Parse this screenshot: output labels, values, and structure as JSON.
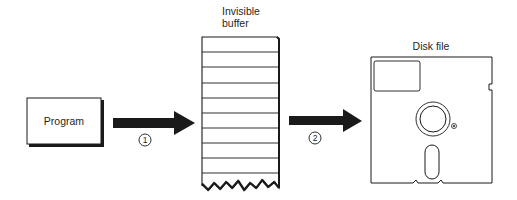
{
  "diagram": {
    "program": {
      "label": "Program"
    },
    "buffer": {
      "label_line1": "Invisible",
      "label_line2": "buffer",
      "rows": 10
    },
    "disk": {
      "label": "Disk file"
    },
    "steps": [
      {
        "number": "1",
        "from": "Program",
        "to": "Invisible buffer"
      },
      {
        "number": "2",
        "from": "Invisible buffer",
        "to": "Disk file"
      }
    ]
  },
  "colors": {
    "ink": "#1a1a1a",
    "background": "#ffffff"
  }
}
